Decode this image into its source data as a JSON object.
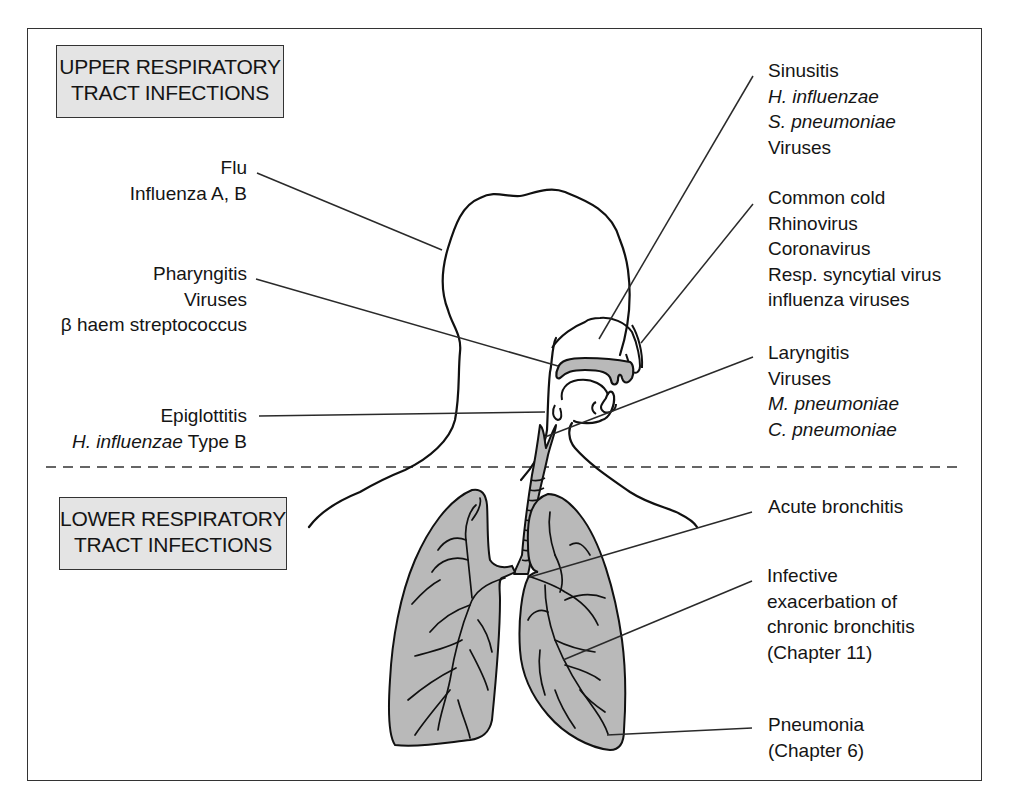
{
  "diagram": {
    "type": "anatomical-labeled-diagram",
    "colors": {
      "frame": "#333333",
      "box_fill": "#e4e4e4",
      "organ_fill": "#b9b9b9",
      "line": "#222222",
      "text": "#151515"
    }
  },
  "sections": {
    "upper": {
      "title_line1": "UPPER RESPIRATORY",
      "title_line2": "TRACT INFECTIONS"
    },
    "lower": {
      "title_line1": "LOWER RESPIRATORY",
      "title_line2": "TRACT INFECTIONS"
    }
  },
  "labels": {
    "flu": {
      "condition": "Flu",
      "organisms": [
        "Influenza A, B"
      ]
    },
    "pharyngitis": {
      "condition": "Pharyngitis",
      "organisms": [
        "Viruses",
        "β haem streptococcus"
      ]
    },
    "epiglottitis": {
      "condition": "Epiglottitis",
      "organism_italic": "H. influenzae",
      "organism_suffix": " Type B"
    },
    "sinusitis": {
      "condition": "Sinusitis",
      "organisms_italic": [
        "H. influenzae",
        "S. pneumoniae"
      ],
      "organisms": [
        "Viruses"
      ]
    },
    "common_cold": {
      "condition": "Common cold",
      "organisms": [
        "Rhinovirus",
        "Coronavirus",
        "Resp. syncytial virus",
        "influenza viruses"
      ]
    },
    "laryngitis": {
      "condition": "Laryngitis",
      "organisms": [
        "Viruses"
      ],
      "organisms_italic": [
        "M. pneumoniae",
        "C. pneumoniae"
      ]
    },
    "acute_bronchitis": {
      "condition": "Acute bronchitis"
    },
    "infective_exacerbation": {
      "lines": [
        "Infective",
        "exacerbation of",
        "chronic bronchitis",
        "(Chapter 11)"
      ]
    },
    "pneumonia": {
      "condition": "Pneumonia",
      "reference": "(Chapter 6)"
    }
  },
  "divider": {
    "style": "dashed",
    "y": 467
  }
}
